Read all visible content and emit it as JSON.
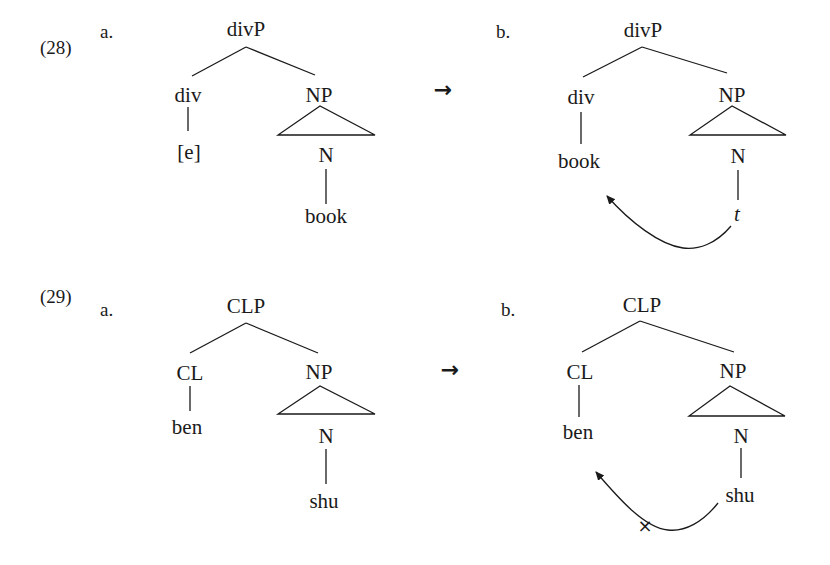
{
  "examples": [
    {
      "number": "(28)",
      "transition_arrow": "→",
      "a": {
        "label": "a.",
        "root": "divP",
        "head": "div",
        "head_content": "[e]",
        "complement": "NP",
        "complement_head": "N",
        "complement_word": "book"
      },
      "b": {
        "label": "b.",
        "root": "divP",
        "head": "div",
        "head_content": "book",
        "complement": "NP",
        "complement_head": "N",
        "complement_word": "t",
        "movement": "licit"
      }
    },
    {
      "number": "(29)",
      "transition_arrow": "→",
      "a": {
        "label": "a.",
        "root": "CLP",
        "head": "CL",
        "head_content": "ben",
        "complement": "NP",
        "complement_head": "N",
        "complement_word": "shu"
      },
      "b": {
        "label": "b.",
        "root": "CLP",
        "head": "CL",
        "head_content": "ben",
        "complement": "NP",
        "complement_head": "N",
        "complement_word": "shu",
        "movement": "blocked",
        "block_mark": "×"
      }
    }
  ]
}
